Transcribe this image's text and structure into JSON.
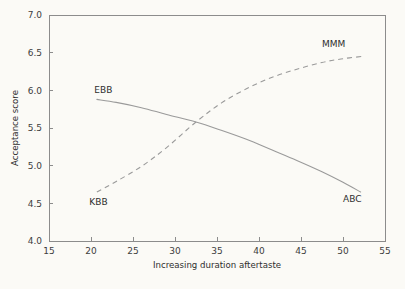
{
  "chart_data": {
    "type": "line",
    "title": "",
    "xlabel": "Increasing duration aftertaste",
    "ylabel": "Acceptance score",
    "xlim": [
      15,
      55
    ],
    "ylim": [
      4.0,
      7.0
    ],
    "xticks": [
      "15",
      "20",
      "25",
      "30",
      "35",
      "40",
      "45",
      "50",
      "55"
    ],
    "yticks": [
      "4.0",
      "4.5",
      "5.0",
      "5.5",
      "6.0",
      "6.5",
      "7.0"
    ],
    "xtick_values": [
      15,
      20,
      25,
      30,
      35,
      40,
      45,
      50,
      55
    ],
    "ytick_values": [
      4.0,
      4.5,
      5.0,
      5.5,
      6.0,
      6.5,
      7.0
    ],
    "grid": false,
    "legend_position": "inline-annotations",
    "line_color": "#9a9a9a",
    "background_color": "#fbfaf6",
    "axis_color": "#8c8c8c",
    "text_color": "#2e2e2e",
    "series": [
      {
        "name": "EBB",
        "style": "solid",
        "start_label": "EBB",
        "end_label": "ABC",
        "x": [
          20.7,
          23.0,
          26.0,
          29.0,
          32.5,
          35.5,
          38.5,
          41.5,
          44.5,
          47.5,
          50.0,
          52.1
        ],
        "values": [
          5.88,
          5.84,
          5.77,
          5.68,
          5.58,
          5.47,
          5.35,
          5.21,
          5.07,
          4.92,
          4.78,
          4.65
        ]
      },
      {
        "name": "MMM",
        "style": "dashed",
        "start_label": "KBB",
        "end_label": "MMM",
        "x": [
          20.7,
          23.0,
          26.0,
          29.0,
          32.5,
          35.5,
          38.5,
          41.5,
          44.5,
          47.5,
          50.0,
          52.3
        ],
        "values": [
          4.65,
          4.79,
          4.99,
          5.24,
          5.58,
          5.83,
          6.02,
          6.17,
          6.28,
          6.37,
          6.42,
          6.45
        ]
      }
    ],
    "annotations": [
      {
        "text": "EBB",
        "x": 20.4,
        "y": 5.97,
        "anchor": "start"
      },
      {
        "text": "ABC",
        "x": 50.0,
        "y": 4.52,
        "anchor": "start"
      },
      {
        "text": "KBB",
        "x": 19.8,
        "y": 4.48,
        "anchor": "start"
      },
      {
        "text": "MMM",
        "x": 47.5,
        "y": 6.58,
        "anchor": "start"
      }
    ]
  }
}
